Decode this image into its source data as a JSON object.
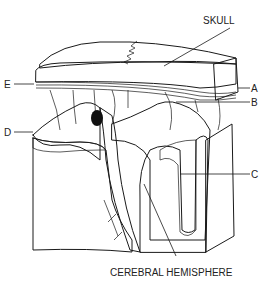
{
  "diagram": {
    "type": "anatomical-cross-section",
    "labels": {
      "skull": "SKULL",
      "a": "A",
      "b": "B",
      "c": "C",
      "d": "D",
      "e": "E",
      "cerebral_hemisphere": "CEREBRAL HEMISPHERE"
    },
    "colors": {
      "ink": "#1a1a1a",
      "background": "#ffffff",
      "stipple": "#555555"
    }
  }
}
